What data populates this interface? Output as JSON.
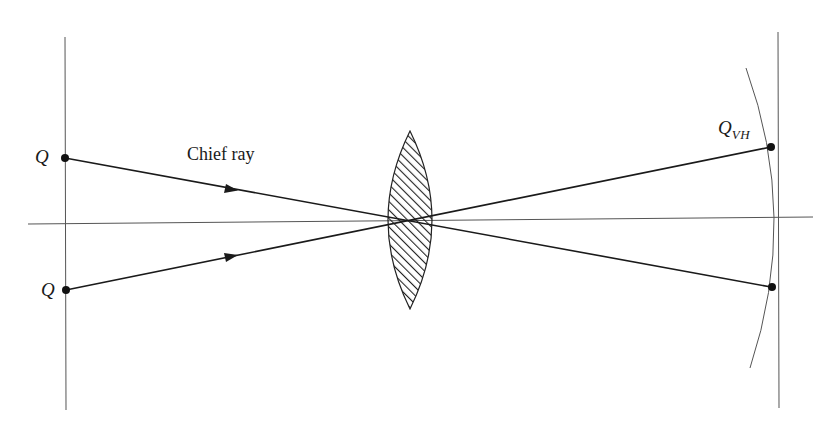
{
  "diagram": {
    "labels": {
      "object_point_upper": "Q",
      "object_point_lower": "Q",
      "chief_ray": "Chief ray",
      "image_point_main": "Q",
      "image_point_subscript": "VH"
    },
    "elements": {
      "object_plane": {
        "x": 65,
        "y_top": 37,
        "y_bottom": 410
      },
      "image_plane": {
        "x": 778,
        "y_top": 32,
        "y_bottom": 408
      },
      "optical_axis": {
        "x_start": 28,
        "y_start": 224,
        "x_end": 813,
        "y_end": 217
      },
      "lens": {
        "center_x": 410,
        "top_y": 131,
        "bottom_y": 309,
        "left_x": 381,
        "right_x": 439,
        "hatched": true
      },
      "ray_upper": {
        "from": [
          65,
          158
        ],
        "cross": [
          410,
          220
        ],
        "to": [
          771,
          147
        ]
      },
      "ray_lower": {
        "from": [
          66,
          290
        ],
        "cross": [
          410,
          220
        ],
        "to": [
          772,
          287
        ]
      },
      "image_surface_arc": {
        "top": [
          746,
          68
        ],
        "vertex": [
          780,
          217
        ],
        "bottom": [
          750,
          368
        ]
      },
      "arrows": [
        [
          230,
          189
        ],
        [
          230,
          257
        ]
      ]
    },
    "colors": {
      "line": "#1a1a1a",
      "thin_line": "#555555",
      "background": "#ffffff"
    }
  }
}
